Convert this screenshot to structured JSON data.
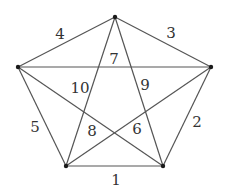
{
  "diagram": {
    "type": "complete-graph-K5",
    "colors": {
      "edge": "#555555",
      "vertex": "#1a1a1a",
      "label": "#333333",
      "background": "#ffffff"
    },
    "vertices": [
      {
        "id": "top",
        "x": 115,
        "y": 17
      },
      {
        "id": "right",
        "x": 211,
        "y": 67
      },
      {
        "id": "bottom-right",
        "x": 163,
        "y": 166
      },
      {
        "id": "bottom-left",
        "x": 66,
        "y": 166
      },
      {
        "id": "left",
        "x": 18,
        "y": 67
      }
    ],
    "edges": [
      {
        "label": "1",
        "from": "bottom-left",
        "to": "bottom-right",
        "label_x": 116,
        "label_y": 180
      },
      {
        "label": "2",
        "from": "right",
        "to": "bottom-right",
        "label_x": 197,
        "label_y": 122
      },
      {
        "label": "3",
        "from": "top",
        "to": "right",
        "label_x": 171,
        "label_y": 33
      },
      {
        "label": "4",
        "from": "left",
        "to": "top",
        "label_x": 60,
        "label_y": 34
      },
      {
        "label": "5",
        "from": "left",
        "to": "bottom-left",
        "label_x": 35,
        "label_y": 127
      },
      {
        "label": "6",
        "from": "bottom-left",
        "to": "right",
        "label_x": 137,
        "label_y": 129
      },
      {
        "label": "7",
        "from": "left",
        "to": "right",
        "label_x": 114,
        "label_y": 59
      },
      {
        "label": "8",
        "from": "left",
        "to": "bottom-right",
        "label_x": 92,
        "label_y": 131
      },
      {
        "label": "9",
        "from": "top",
        "to": "bottom-right",
        "label_x": 145,
        "label_y": 85
      },
      {
        "label": "10",
        "from": "top",
        "to": "bottom-left",
        "label_x": 80,
        "label_y": 88
      }
    ]
  }
}
